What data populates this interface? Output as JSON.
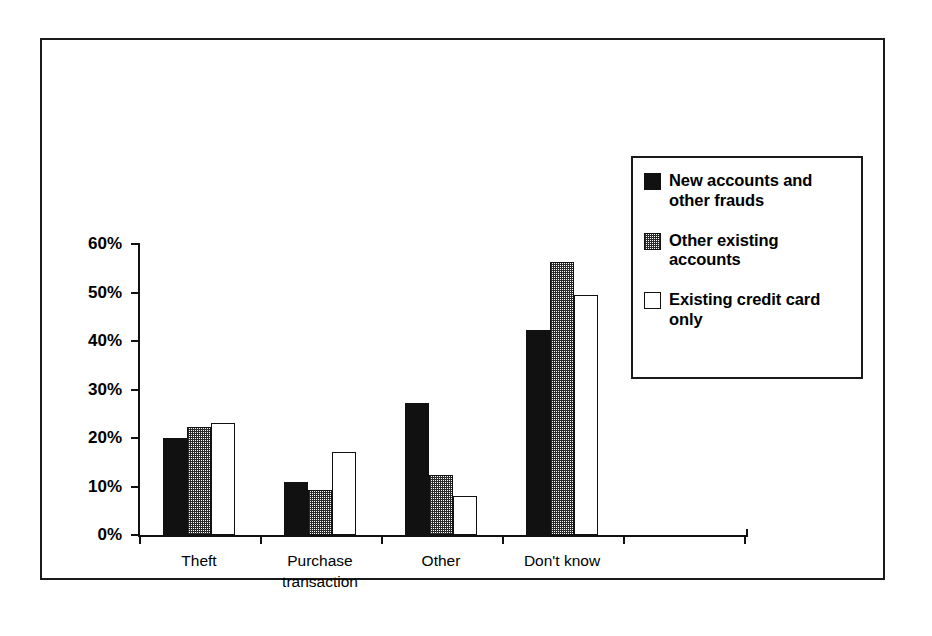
{
  "chart_data": {
    "type": "bar",
    "title": "",
    "subtitle": "",
    "xlabel": "",
    "ylabel": "",
    "categories": [
      "Theft",
      "Purchase transaction",
      "Other",
      "Don't know"
    ],
    "category_lines": [
      [
        "Theft"
      ],
      [
        "Purchase",
        "transaction"
      ],
      [
        "Other"
      ],
      [
        "Don't know"
      ]
    ],
    "series": [
      {
        "name": "New accounts and other frauds",
        "fill": "black",
        "values": [
          20.0,
          11.0,
          27.2,
          42.3
        ]
      },
      {
        "name": "Other existing accounts",
        "fill": "gray-dither",
        "values": [
          22.2,
          9.3,
          12.4,
          56.3
        ]
      },
      {
        "name": "Existing credit card only",
        "fill": "white",
        "values": [
          23.0,
          17.1,
          8.0,
          49.4
        ]
      }
    ],
    "ylim": [
      0,
      60
    ],
    "ytick_values": [
      0,
      10,
      20,
      30,
      40,
      50,
      60
    ],
    "ytick_labels": [
      "0%",
      "10%",
      "20%",
      "30%",
      "40%",
      "50%",
      "60%"
    ],
    "grid": false,
    "legend_position": "upper-right-inset",
    "value_format": "percent"
  },
  "legend": {
    "entries": [
      {
        "label_lines": [
          "New accounts and",
          "other frauds"
        ],
        "swatch": "black-square-icon"
      },
      {
        "label_lines": [
          "Other existing",
          "accounts"
        ],
        "swatch": "gray-square-icon"
      },
      {
        "label_lines": [
          "Existing credit card",
          "only"
        ],
        "swatch": "white-square-icon"
      }
    ]
  },
  "colors": {
    "series_black": "#111111",
    "series_gray": "#808080",
    "series_white": "#ffffff",
    "axis": "#111111",
    "frame": "#1a1a1a",
    "background": "#ffffff"
  }
}
